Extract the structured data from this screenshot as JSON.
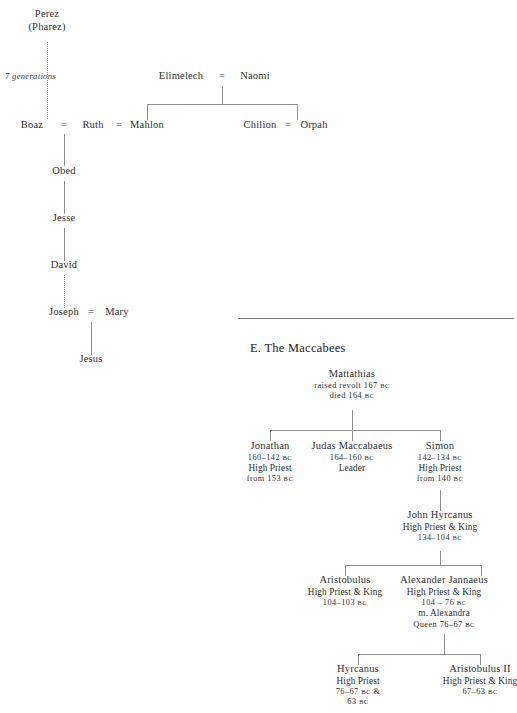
{
  "page": {
    "width": 514,
    "height": 713,
    "background": "#ffffff",
    "ink": "#2f2f2f",
    "rule_color": "#777777",
    "line_color": "#8f8f8f"
  },
  "ruth_tree": {
    "title": "",
    "nodes": {
      "perez": {
        "line1": "Perez",
        "line2": "(Pharez)"
      },
      "generations_note": "7 generations",
      "boaz": {
        "name": "Boaz"
      },
      "ruth": {
        "name": "Ruth"
      },
      "mahlon": {
        "name": "Mahlon"
      },
      "chilion": {
        "name": "Chilion"
      },
      "orpah": {
        "name": "Orpah"
      },
      "elimelech": {
        "name": "Elimelech"
      },
      "naomi": {
        "name": "Naomi"
      },
      "obed": {
        "name": "Obed"
      },
      "jesse": {
        "name": "Jesse"
      },
      "david": {
        "name": "David"
      },
      "joseph": {
        "name": "Joseph"
      },
      "mary": {
        "name": "Mary"
      },
      "jesus": {
        "name": "Jesus"
      }
    },
    "marriage_symbol": "="
  },
  "maccabees": {
    "section_heading": "E. The Maccabees",
    "nodes": {
      "mattathias": {
        "name": "Mattathias",
        "lines": [
          "raised revolt 167 BC",
          "died 164 BC"
        ],
        "line1_text": "raised revolt 167",
        "line1_bc": "BC",
        "line2_text": "died 164",
        "line2_bc": "BC"
      },
      "jonathan": {
        "name": "Jonathan",
        "dates": "160–142",
        "dates_bc": "BC",
        "role": "High Priest",
        "role_from": "from 153",
        "role_from_bc": "BC"
      },
      "judas": {
        "name": "Judas Maccabaeus",
        "dates": "164–160",
        "dates_bc": "BC",
        "role": "Leader"
      },
      "simon": {
        "name": "Simon",
        "dates": "142–134",
        "dates_bc": "BC",
        "role": "High Priest",
        "role_from": "from 140",
        "role_from_bc": "BC"
      },
      "john_hyrcanus": {
        "name": "John Hyrcanus",
        "role": "High Priest & King",
        "dates": "134–104",
        "dates_bc": "BC"
      },
      "aristobulus": {
        "name": "Aristobulus",
        "role": "High Priest & King",
        "dates": "104–103",
        "dates_bc": "BC"
      },
      "alexander_jannaeus": {
        "name": "Alexander Jannaeus",
        "role": "High Priest & King",
        "dates": "104 – 76",
        "dates_bc": "BC",
        "spouse": "m. Alexandra",
        "spouse_title": "Queen 76–67",
        "spouse_title_bc": "BC"
      },
      "hyrcanus": {
        "name": "Hyrcanus",
        "role": "High Priest",
        "dates": "76–67",
        "dates_bc": "BC",
        "dates_suffix": "&",
        "dates2": "63",
        "dates2_bc": "BC"
      },
      "aristobulus_ii": {
        "name": "Aristobulus II",
        "role": "High Priest & King",
        "dates": "67–63",
        "dates_bc": "BC"
      }
    }
  }
}
